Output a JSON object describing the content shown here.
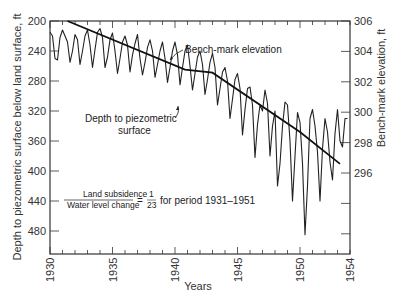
{
  "chart_data": {
    "type": "line",
    "title": "",
    "xlabel": "Years",
    "ylabel_left": "Depth to piezometric surface below land surface, ft",
    "ylabel_right": "Bench-mark elevation, ft",
    "x_ticks": [
      "1930",
      "1935",
      "1940",
      "1945",
      "1950",
      "1954"
    ],
    "y_left_ticks": [
      200,
      240,
      280,
      320,
      360,
      400,
      440,
      480
    ],
    "y_right_ticks": [
      306,
      304,
      302,
      300,
      298,
      296
    ],
    "xlim": [
      1930,
      1954
    ],
    "ylim_left": [
      200,
      510
    ],
    "ylim_right_top": 306,
    "grid": false,
    "series": [
      {
        "name": "Bench-mark elevation",
        "axis": "right",
        "x": [
          1931.4,
          1940.8,
          1943.0,
          1950.0,
          1953.2
        ],
        "values": [
          306.0,
          302.8,
          302.6,
          298.7,
          296.6
        ]
      },
      {
        "name": "Depth to piezometric surface",
        "axis": "left",
        "x": [
          1930.0,
          1930.2,
          1930.4,
          1930.6,
          1930.8,
          1931.0,
          1931.2,
          1931.4,
          1931.6,
          1931.8,
          1932.0,
          1932.2,
          1932.4,
          1932.6,
          1932.8,
          1933.0,
          1933.2,
          1933.4,
          1933.6,
          1933.8,
          1934.0,
          1934.2,
          1934.4,
          1934.6,
          1934.8,
          1935.0,
          1935.2,
          1935.4,
          1935.6,
          1935.8,
          1936.0,
          1936.2,
          1936.4,
          1936.6,
          1936.8,
          1937.0,
          1937.2,
          1937.4,
          1937.6,
          1937.8,
          1938.0,
          1938.2,
          1938.4,
          1938.6,
          1938.8,
          1939.0,
          1939.2,
          1939.4,
          1939.6,
          1939.8,
          1940.0,
          1940.2,
          1940.4,
          1940.6,
          1940.8,
          1941.0,
          1941.2,
          1941.4,
          1941.6,
          1941.8,
          1942.0,
          1942.2,
          1942.4,
          1942.6,
          1942.8,
          1943.0,
          1943.2,
          1943.4,
          1943.6,
          1943.8,
          1944.0,
          1944.2,
          1944.4,
          1944.6,
          1944.8,
          1945.0,
          1945.2,
          1945.4,
          1945.6,
          1945.8,
          1946.0,
          1946.2,
          1946.4,
          1946.6,
          1946.8,
          1947.0,
          1947.2,
          1947.4,
          1947.6,
          1947.8,
          1948.0,
          1948.2,
          1948.4,
          1948.6,
          1948.8,
          1949.0,
          1949.2,
          1949.4,
          1949.6,
          1949.8,
          1950.0,
          1950.2,
          1950.4,
          1950.6,
          1950.8,
          1951.0,
          1951.2,
          1951.4,
          1951.6,
          1951.8,
          1952.0,
          1952.2,
          1952.4,
          1952.6,
          1952.8,
          1953.0,
          1953.2,
          1953.4,
          1953.6,
          1953.8
        ],
        "values": [
          215,
          220,
          250,
          252,
          222,
          212,
          220,
          228,
          255,
          240,
          218,
          225,
          258,
          240,
          220,
          212,
          232,
          262,
          238,
          215,
          210,
          222,
          262,
          248,
          225,
          216,
          240,
          270,
          250,
          228,
          220,
          232,
          268,
          245,
          230,
          218,
          250,
          272,
          255,
          235,
          225,
          240,
          275,
          258,
          240,
          228,
          250,
          282,
          262,
          240,
          228,
          245,
          285,
          262,
          240,
          232,
          260,
          292,
          270,
          248,
          240,
          258,
          298,
          278,
          255,
          243,
          262,
          312,
          290,
          268,
          262,
          280,
          330,
          304,
          278,
          270,
          290,
          352,
          318,
          290,
          288,
          312,
          382,
          338,
          312,
          320,
          292,
          310,
          380,
          340,
          320,
          420,
          390,
          340,
          308,
          312,
          360,
          440,
          380,
          322,
          335,
          390,
          485,
          420,
          330,
          318,
          340,
          375,
          440,
          370,
          330,
          348,
          388,
          412,
          350,
          318,
          360,
          368,
          330,
          330
        ]
      }
    ],
    "annotations": [
      {
        "text": "Bench-mark elevation"
      },
      {
        "text": "Depth to piezometric surface"
      },
      {
        "text": "Land subsidence / Water level change = 1/23 for period 1931–1951"
      }
    ]
  },
  "labels": {
    "xlabel": "Years",
    "ylabel_left": "Depth to piezometric surface below land surface, ft",
    "ylabel_right": "Bench-mark elevation, ft",
    "bench_label": "Bench-mark elevation",
    "depth_label_line1": "Depth to piezometric",
    "depth_label_line2": "surface",
    "ratio_numerator": "Land subsidence",
    "ratio_denominator": "Water level change",
    "ratio_equals": "=",
    "ratio_value_num": "1",
    "ratio_value_den": "23",
    "ratio_suffix": "for period 1931–1951"
  }
}
